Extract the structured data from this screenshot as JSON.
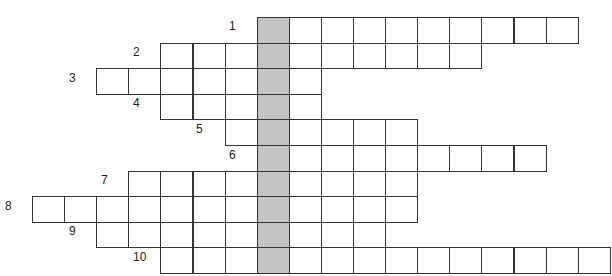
{
  "puzzle": {
    "cell_width": 32.1,
    "row_height": 25.6,
    "origin_x": 32,
    "origin_y": 17,
    "shaded_col": 7,
    "shaded_color": "#c4c4c4",
    "rows": [
      {
        "number": "1",
        "start_col": 7,
        "end_col": 16,
        "label_x": 229,
        "label_y": 19
      },
      {
        "number": "2",
        "start_col": 4,
        "end_col": 13,
        "label_x": 133,
        "label_y": 45
      },
      {
        "number": "3",
        "start_col": 2,
        "end_col": 8,
        "label_x": 69,
        "label_y": 71
      },
      {
        "number": "4",
        "start_col": 4,
        "end_col": 8,
        "label_x": 133,
        "label_y": 96
      },
      {
        "number": "5",
        "start_col": 6,
        "end_col": 11,
        "label_x": 196,
        "label_y": 122
      },
      {
        "number": "6",
        "start_col": 7,
        "end_col": 15,
        "label_x": 229,
        "label_y": 148
      },
      {
        "number": "7",
        "start_col": 3,
        "end_col": 11,
        "label_x": 101,
        "label_y": 173
      },
      {
        "number": "8",
        "start_col": 0,
        "end_col": 11,
        "label_x": 5,
        "label_y": 199
      },
      {
        "number": "9",
        "start_col": 2,
        "end_col": 10,
        "label_x": 69,
        "label_y": 224
      },
      {
        "number": "10",
        "start_col": 4,
        "end_col": 17,
        "label_x": 133,
        "label_y": 250
      }
    ]
  }
}
